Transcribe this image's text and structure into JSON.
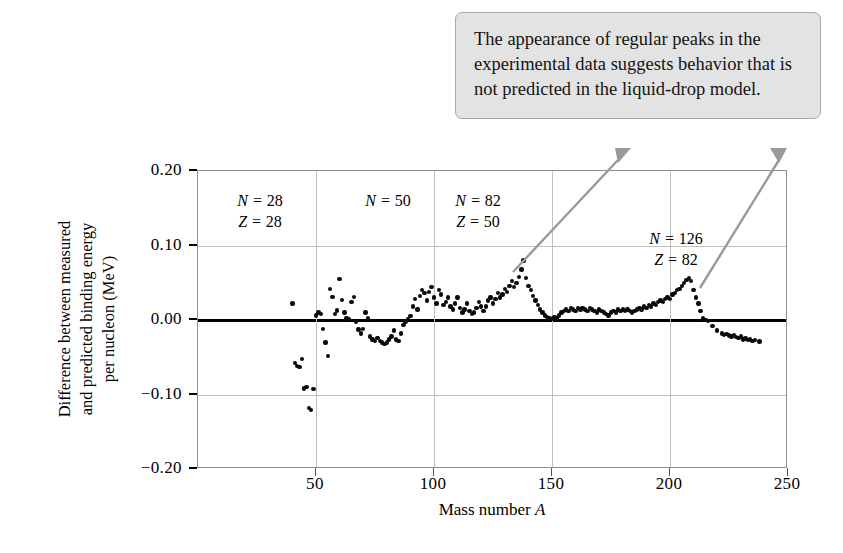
{
  "figure": {
    "background_color": "#ffffff",
    "dot_color": "#0a0a0a",
    "grid_color": "#bfbfbf",
    "frame_color": "#8e8e8e",
    "callout_fill": "#e3e3e3",
    "callout_border": "#a8a8a8",
    "leader_color": "#9a9a9a"
  },
  "callout": {
    "text": "The appearance of regular peaks in the experimental data suggests behavior that is not predicted in the liquid-drop model."
  },
  "annotations": [
    {
      "id": "magic-28",
      "line1": "N = 28",
      "line2": "Z = 28",
      "x": 260,
      "y": 190
    },
    {
      "id": "magic-50",
      "line1": "N = 50",
      "line2": "",
      "x": 388,
      "y": 190
    },
    {
      "id": "magic-82",
      "line1": "N = 82",
      "line2": "Z = 50",
      "x": 478,
      "y": 190
    },
    {
      "id": "magic-126",
      "line1": "N = 126",
      "line2": "Z = 82",
      "x": 676,
      "y": 228
    }
  ],
  "chart_data": {
    "type": "scatter",
    "title": "",
    "xlabel": "Mass number A",
    "ylabel": "Difference between measured\nand predicted binding energy\nper nucleon (MeV)",
    "xlim": [
      0,
      250
    ],
    "ylim": [
      -0.2,
      0.2
    ],
    "xticks": [
      50,
      100,
      150,
      200,
      250
    ],
    "yticks": [
      0.2,
      0.1,
      0.0,
      -0.1,
      -0.2
    ],
    "ytick_labels": [
      "0.20",
      "0.10",
      "0.00",
      "−0.10",
      "−0.20"
    ],
    "xtick_labels": [
      "50",
      "100",
      "150",
      "200",
      "250"
    ],
    "grid": true,
    "zero_reference_line": 0.0,
    "legend": "none",
    "series_name": "Measured minus liquid-drop prediction",
    "points": [
      [
        40,
        0.022
      ],
      [
        41,
        -0.058
      ],
      [
        42,
        -0.062
      ],
      [
        43,
        -0.063
      ],
      [
        44,
        -0.052
      ],
      [
        45,
        -0.092
      ],
      [
        46,
        -0.09
      ],
      [
        47,
        -0.118
      ],
      [
        48,
        -0.121
      ],
      [
        49,
        -0.093
      ],
      [
        50,
        0.006
      ],
      [
        51,
        0.01
      ],
      [
        52,
        0.008
      ],
      [
        53,
        -0.012
      ],
      [
        54,
        -0.03
      ],
      [
        55,
        -0.048
      ],
      [
        56,
        0.042
      ],
      [
        57,
        0.031
      ],
      [
        58,
        0.008
      ],
      [
        59,
        0.013
      ],
      [
        60,
        0.055
      ],
      [
        61,
        0.027
      ],
      [
        62,
        0.01
      ],
      [
        63,
        0.003
      ],
      [
        64,
        0.001
      ],
      [
        65,
        0.024
      ],
      [
        66,
        0.031
      ],
      [
        67,
        -0.002
      ],
      [
        68,
        -0.013
      ],
      [
        69,
        -0.018
      ],
      [
        70,
        -0.012
      ],
      [
        71,
        0.01
      ],
      [
        72,
        0.002
      ],
      [
        73,
        -0.022
      ],
      [
        74,
        -0.026
      ],
      [
        75,
        -0.028
      ],
      [
        76,
        -0.024
      ],
      [
        77,
        -0.028
      ],
      [
        78,
        -0.03
      ],
      [
        79,
        -0.032
      ],
      [
        80,
        -0.03
      ],
      [
        81,
        -0.026
      ],
      [
        82,
        -0.022
      ],
      [
        83,
        -0.014
      ],
      [
        84,
        -0.026
      ],
      [
        85,
        -0.028
      ],
      [
        86,
        -0.018
      ],
      [
        87,
        -0.007
      ],
      [
        88,
        -0.002
      ],
      [
        89,
        0.001
      ],
      [
        90,
        0.005
      ],
      [
        91,
        0.018
      ],
      [
        92,
        0.028
      ],
      [
        93,
        0.014
      ],
      [
        94,
        0.032
      ],
      [
        95,
        0.04
      ],
      [
        96,
        0.036
      ],
      [
        97,
        0.026
      ],
      [
        98,
        0.038
      ],
      [
        99,
        0.044
      ],
      [
        100,
        0.03
      ],
      [
        101,
        0.022
      ],
      [
        102,
        0.04
      ],
      [
        103,
        0.034
      ],
      [
        104,
        0.02
      ],
      [
        105,
        0.024
      ],
      [
        106,
        0.03
      ],
      [
        107,
        0.018
      ],
      [
        108,
        0.014
      ],
      [
        109,
        0.022
      ],
      [
        110,
        0.03
      ],
      [
        111,
        0.016
      ],
      [
        112,
        0.01
      ],
      [
        113,
        0.014
      ],
      [
        114,
        0.022
      ],
      [
        115,
        0.012
      ],
      [
        116,
        0.008
      ],
      [
        117,
        0.01
      ],
      [
        118,
        0.016
      ],
      [
        119,
        0.024
      ],
      [
        120,
        0.018
      ],
      [
        121,
        0.012
      ],
      [
        122,
        0.018
      ],
      [
        123,
        0.026
      ],
      [
        124,
        0.03
      ],
      [
        125,
        0.022
      ],
      [
        126,
        0.028
      ],
      [
        127,
        0.036
      ],
      [
        128,
        0.03
      ],
      [
        129,
        0.034
      ],
      [
        130,
        0.042
      ],
      [
        131,
        0.038
      ],
      [
        132,
        0.046
      ],
      [
        133,
        0.052
      ],
      [
        134,
        0.044
      ],
      [
        135,
        0.05
      ],
      [
        136,
        0.058
      ],
      [
        137,
        0.068
      ],
      [
        138,
        0.08
      ],
      [
        139,
        0.056
      ],
      [
        140,
        0.046
      ],
      [
        141,
        0.04
      ],
      [
        142,
        0.032
      ],
      [
        143,
        0.026
      ],
      [
        144,
        0.02
      ],
      [
        145,
        0.014
      ],
      [
        146,
        0.01
      ],
      [
        147,
        0.006
      ],
      [
        148,
        0.004
      ],
      [
        149,
        0.002
      ],
      [
        150,
        0.001
      ],
      [
        151,
        0.004
      ],
      [
        152,
        0.002
      ],
      [
        153,
        0.006
      ],
      [
        154,
        0.01
      ],
      [
        155,
        0.012
      ],
      [
        156,
        0.014
      ],
      [
        157,
        0.012
      ],
      [
        158,
        0.016
      ],
      [
        159,
        0.014
      ],
      [
        160,
        0.012
      ],
      [
        161,
        0.016
      ],
      [
        162,
        0.014
      ],
      [
        163,
        0.016
      ],
      [
        164,
        0.014
      ],
      [
        165,
        0.012
      ],
      [
        166,
        0.016
      ],
      [
        167,
        0.014
      ],
      [
        168,
        0.012
      ],
      [
        169,
        0.01
      ],
      [
        170,
        0.014
      ],
      [
        171,
        0.012
      ],
      [
        172,
        0.01
      ],
      [
        173,
        0.008
      ],
      [
        174,
        0.006
      ],
      [
        175,
        0.01
      ],
      [
        176,
        0.012
      ],
      [
        177,
        0.01
      ],
      [
        178,
        0.014
      ],
      [
        179,
        0.012
      ],
      [
        180,
        0.014
      ],
      [
        181,
        0.012
      ],
      [
        182,
        0.014
      ],
      [
        183,
        0.012
      ],
      [
        184,
        0.01
      ],
      [
        185,
        0.012
      ],
      [
        186,
        0.014
      ],
      [
        187,
        0.016
      ],
      [
        188,
        0.014
      ],
      [
        189,
        0.018
      ],
      [
        190,
        0.016
      ],
      [
        191,
        0.02
      ],
      [
        192,
        0.018
      ],
      [
        193,
        0.022
      ],
      [
        194,
        0.02
      ],
      [
        195,
        0.024
      ],
      [
        196,
        0.026
      ],
      [
        197,
        0.024
      ],
      [
        198,
        0.028
      ],
      [
        199,
        0.03
      ],
      [
        200,
        0.028
      ],
      [
        201,
        0.034
      ],
      [
        202,
        0.036
      ],
      [
        203,
        0.04
      ],
      [
        204,
        0.042
      ],
      [
        205,
        0.046
      ],
      [
        206,
        0.05
      ],
      [
        207,
        0.054
      ],
      [
        208,
        0.056
      ],
      [
        209,
        0.052
      ],
      [
        210,
        0.04
      ],
      [
        211,
        0.03
      ],
      [
        212,
        0.022
      ],
      [
        213,
        0.012
      ],
      [
        214,
        0.002
      ],
      [
        215,
        0.0
      ],
      [
        216,
        -0.001
      ],
      [
        218,
        -0.008
      ],
      [
        220,
        -0.014
      ],
      [
        222,
        -0.018
      ],
      [
        223,
        -0.02
      ],
      [
        224,
        -0.019
      ],
      [
        225,
        -0.021
      ],
      [
        226,
        -0.022
      ],
      [
        227,
        -0.02
      ],
      [
        228,
        -0.023
      ],
      [
        229,
        -0.024
      ],
      [
        230,
        -0.022
      ],
      [
        231,
        -0.026
      ],
      [
        232,
        -0.025
      ],
      [
        233,
        -0.027
      ],
      [
        234,
        -0.026
      ],
      [
        235,
        -0.028
      ],
      [
        236,
        -0.027
      ],
      [
        238,
        -0.029
      ]
    ]
  }
}
